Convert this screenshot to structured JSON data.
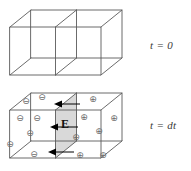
{
  "figure": {
    "stroke_color": "#5a5a5a",
    "charge_color": "#6b6b6b",
    "field_plane_fill": "#d9d9d9",
    "arrow_color": "#000000",
    "background": "#ffffff"
  },
  "panels": [
    {
      "id": "panel-top",
      "time_label": "t = 0",
      "description": "Empty wireframe box divided into two cells, no charges",
      "charges": [],
      "field_arrows": [],
      "field_label": ""
    },
    {
      "id": "panel-bottom",
      "time_label": "t = dt",
      "description": "Wireframe box with negative charges at left, positive charges at right, shaded central plane with field E",
      "field_label": "E",
      "negative_symbol": "⊖",
      "positive_symbol": "⊕",
      "negative_charges": [
        {
          "x": 26,
          "y": 101
        },
        {
          "x": 42,
          "y": 97
        },
        {
          "x": 20,
          "y": 118
        },
        {
          "x": 37,
          "y": 118
        },
        {
          "x": 30,
          "y": 133
        },
        {
          "x": 10,
          "y": 144
        },
        {
          "x": 34,
          "y": 154
        }
      ],
      "positive_charges": [
        {
          "x": 93,
          "y": 99
        },
        {
          "x": 84,
          "y": 117
        },
        {
          "x": 114,
          "y": 118
        },
        {
          "x": 99,
          "y": 131
        },
        {
          "x": 76,
          "y": 137
        },
        {
          "x": 80,
          "y": 155
        },
        {
          "x": 103,
          "y": 155
        }
      ],
      "field_arrows": [
        {
          "tip_x": 54,
          "y": 104,
          "tail_x": 80
        },
        {
          "tip_x": 50,
          "y": 127,
          "tail_x": 78
        },
        {
          "tip_x": 48,
          "y": 152,
          "tail_x": 74
        }
      ]
    }
  ],
  "legend": {
    "negative_meaning": "negative charge",
    "positive_meaning": "positive charge",
    "field_meaning": "electric field vector E"
  }
}
